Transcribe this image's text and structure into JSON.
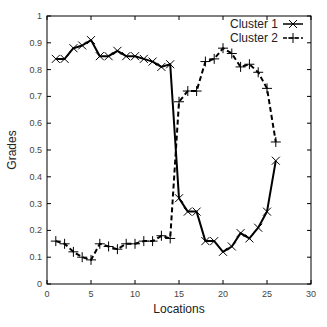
{
  "chart_data": {
    "type": "line",
    "title": "",
    "xlabel": "Locations",
    "ylabel": "Grades",
    "xlim": [
      0,
      30
    ],
    "ylim": [
      0,
      1
    ],
    "xticks": [
      0,
      5,
      10,
      15,
      20,
      25,
      30
    ],
    "yticks": [
      0,
      0.1,
      0.2,
      0.3,
      0.4,
      0.5,
      0.6,
      0.7,
      0.8,
      0.9,
      1
    ],
    "ytick_labels": [
      "0",
      "0.1",
      "0.2",
      "0.3",
      "0.4",
      "0.5",
      "0.6",
      "0.7",
      "0.8",
      "0.9",
      "1"
    ],
    "grid": false,
    "legend_position": "top-right",
    "x": [
      1,
      2,
      3,
      4,
      5,
      6,
      7,
      8,
      9,
      10,
      11,
      12,
      13,
      14,
      15,
      16,
      17,
      18,
      19,
      20,
      21,
      22,
      23,
      24,
      25,
      26
    ],
    "series": [
      {
        "name": "Cluster 1",
        "line_style": "solid",
        "marker": "x",
        "values": [
          0.84,
          0.84,
          0.88,
          0.89,
          0.91,
          0.85,
          0.85,
          0.87,
          0.85,
          0.85,
          0.84,
          0.83,
          0.81,
          0.82,
          0.32,
          0.27,
          0.27,
          0.16,
          0.16,
          0.12,
          0.14,
          0.19,
          0.17,
          0.21,
          0.27,
          0.46
        ]
      },
      {
        "name": "Cluster 2",
        "line_style": "dashed",
        "marker": "+",
        "values": [
          0.16,
          0.15,
          0.12,
          0.1,
          0.09,
          0.15,
          0.14,
          0.13,
          0.15,
          0.15,
          0.16,
          0.16,
          0.18,
          0.17,
          0.68,
          0.72,
          0.72,
          0.83,
          0.84,
          0.88,
          0.86,
          0.81,
          0.82,
          0.79,
          0.73,
          0.53
        ]
      }
    ]
  },
  "colors": {
    "line": "#000000",
    "axis": "#000000",
    "background": "#ffffff"
  }
}
